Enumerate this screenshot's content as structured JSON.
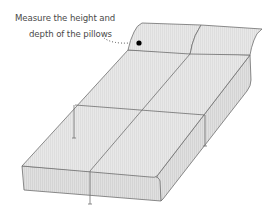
{
  "diagram": {
    "type": "illustration",
    "annotation": {
      "line1": "Measure the height and",
      "line2": "depth of the pillows"
    },
    "colors": {
      "surface": "#e6e6e6",
      "surface_side": "#dcdcdc",
      "outline": "#6e6e6e",
      "text": "#4a4a4a",
      "marker": "#000000"
    },
    "parts": [
      "pillow-left",
      "pillow-right",
      "mattress-top",
      "mattress-front-face",
      "mattress-side-face",
      "lengthwise-seam",
      "cross-seam",
      "dimension-lines",
      "measurement-marker"
    ]
  }
}
